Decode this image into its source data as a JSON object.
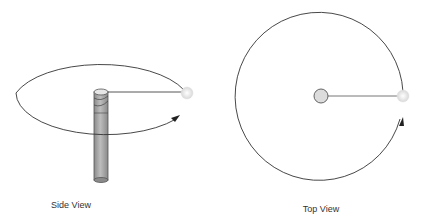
{
  "diagram": {
    "panels": [
      {
        "id": "side-view",
        "label": "Side View",
        "elements": [
          "pole",
          "orbit-ellipse",
          "tether-line",
          "ball",
          "direction-arrow"
        ]
      },
      {
        "id": "top-view",
        "label": "Top View",
        "elements": [
          "pole-top",
          "orbit-circle",
          "tether-line",
          "ball",
          "direction-arrow"
        ]
      }
    ],
    "colors": {
      "stroke": "#333333",
      "pole_fill": "#a8a8a8",
      "pole_top_fill": "#e0e0e0",
      "ball_fill": "#e8e8e8",
      "background": "#ffffff"
    }
  }
}
